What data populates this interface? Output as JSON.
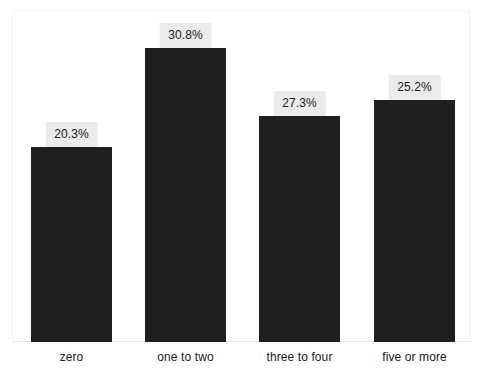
{
  "chart_data": {
    "type": "bar",
    "title": "",
    "subtitle": "",
    "xlabel": "",
    "ylabel": "",
    "categories": [
      "zero",
      "one to two",
      "three to four",
      "five or more"
    ],
    "values": [
      20.3,
      30.8,
      27.3,
      25.2
    ],
    "data_labels": [
      "20.3%",
      "30.8%",
      "27.3%",
      "25.2%"
    ],
    "ylim": [
      0,
      34.6
    ],
    "grid": false,
    "legend": false,
    "legend_position": "none",
    "bar_color": "#1f1f1f",
    "label_box_color": "#ebebeb",
    "label_text_color": "#1a1a1a",
    "frame_color": "#f2f2f2",
    "axis_line_color": "#e8e8e8",
    "background_color": "#ffffff"
  },
  "bars": [
    {
      "category": "zero",
      "value": 20.3,
      "label": "20.3%",
      "left_px": 31,
      "width_px": 81,
      "height_px": 195
    },
    {
      "category": "one to two",
      "value": 30.8,
      "label": "30.8%",
      "left_px": 145,
      "width_px": 81,
      "height_px": 294
    },
    {
      "category": "three to four",
      "value": 27.3,
      "label": "27.3%",
      "left_px": 259,
      "width_px": 81,
      "height_px": 226
    },
    {
      "category": "five or more",
      "value": 25.2,
      "label": "25.2%",
      "left_px": 374,
      "width_px": 81,
      "height_px": 242
    }
  ]
}
